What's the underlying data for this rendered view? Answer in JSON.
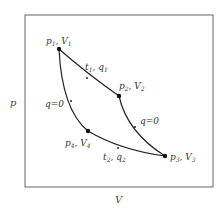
{
  "diagram": {
    "type": "p-V diagram (Carnot cycle)",
    "axes": {
      "x_label": "V",
      "y_label": "p"
    },
    "states": [
      {
        "id": 1,
        "p": "p",
        "p_sub": "1",
        "v": "V",
        "v_sub": "1"
      },
      {
        "id": 2,
        "p": "p",
        "p_sub": "2",
        "v": "V",
        "v_sub": "2"
      },
      {
        "id": 3,
        "p": "p",
        "p_sub": "3",
        "v": "V",
        "v_sub": "3"
      },
      {
        "id": 4,
        "p": "p",
        "p_sub": "4",
        "v": "V",
        "v_sub": "4"
      }
    ],
    "processes": [
      {
        "from": 1,
        "to": 2,
        "label_main": "t",
        "label_main_sub": "1",
        "label_q": "q",
        "label_q_sub": "1"
      },
      {
        "from": 2,
        "to": 3,
        "label": "q=0"
      },
      {
        "from": 3,
        "to": 4,
        "label_main": "t",
        "label_main_sub": "2",
        "label_q": "q",
        "label_q_sub": "2"
      },
      {
        "from": 4,
        "to": 1,
        "label": "q=0"
      }
    ],
    "colors": {
      "line": "#222222",
      "frame": "#666666",
      "text": "#333333"
    }
  }
}
